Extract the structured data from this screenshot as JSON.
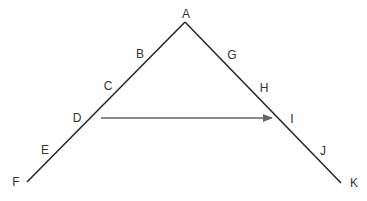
{
  "diagram": {
    "labels": [
      {
        "id": "A",
        "text": "A",
        "x": 186,
        "y": 14
      },
      {
        "id": "B",
        "text": "B",
        "x": 140,
        "y": 54
      },
      {
        "id": "C",
        "text": "C",
        "x": 108,
        "y": 86
      },
      {
        "id": "D",
        "text": "D",
        "x": 77,
        "y": 118
      },
      {
        "id": "E",
        "text": "E",
        "x": 45,
        "y": 150
      },
      {
        "id": "F",
        "text": "F",
        "x": 16,
        "y": 182
      },
      {
        "id": "G",
        "text": "G",
        "x": 232,
        "y": 55
      },
      {
        "id": "H",
        "text": "H",
        "x": 264,
        "y": 88
      },
      {
        "id": "I",
        "text": "I",
        "x": 292,
        "y": 119
      },
      {
        "id": "J",
        "text": "J",
        "x": 323,
        "y": 151
      },
      {
        "id": "K",
        "text": "K",
        "x": 354,
        "y": 183
      }
    ],
    "line_color": "#222222",
    "arrow_color": "#666666"
  }
}
